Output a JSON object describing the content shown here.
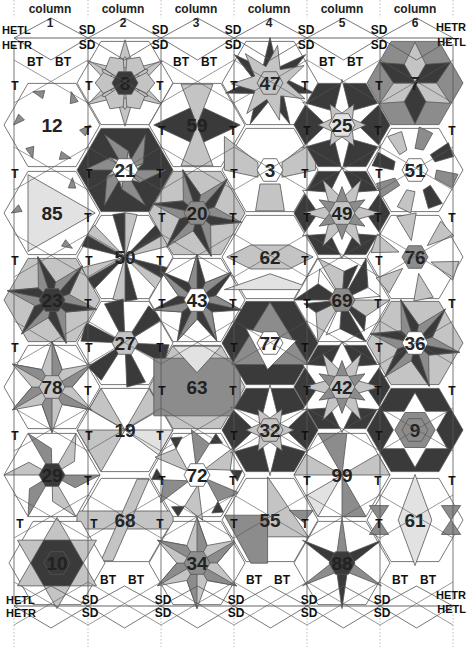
{
  "diagram": {
    "colors": {
      "line": "#555555",
      "dark": "#3a3a3a",
      "mid": "#8c8c8c",
      "light": "#c4c4c4",
      "pale": "#e2e2e2",
      "white": "#ffffff",
      "text": "#1a1a1a"
    },
    "column_headers": [
      {
        "word": "column",
        "num": "1",
        "x": 50
      },
      {
        "word": "column",
        "num": "2",
        "x": 123
      },
      {
        "word": "column",
        "num": "3",
        "x": 196
      },
      {
        "word": "column",
        "num": "4",
        "x": 269
      },
      {
        "word": "column",
        "num": "5",
        "x": 342
      },
      {
        "word": "column",
        "num": "6",
        "x": 415
      }
    ],
    "edge_labels": {
      "top_left": [
        "HETL",
        "HETR"
      ],
      "top_right": [
        "HETR",
        "HETL"
      ],
      "bottom_left": [
        "HETL",
        "HETR"
      ],
      "bottom_right": [
        "HETR",
        "HETL"
      ],
      "top_sd": [
        {
          "x": 87,
          "text": "SD"
        },
        {
          "x": 160,
          "text": "SD"
        },
        {
          "x": 233,
          "text": "SD"
        },
        {
          "x": 306,
          "text": "SD"
        },
        {
          "x": 379,
          "text": "SD"
        }
      ],
      "bottom_sd": [
        {
          "x": 90,
          "text": "SD"
        },
        {
          "x": 163,
          "text": "SD"
        },
        {
          "x": 236,
          "text": "SD"
        },
        {
          "x": 309,
          "text": "SD"
        },
        {
          "x": 382,
          "text": "SD"
        }
      ],
      "top_bt": [
        {
          "x": 35,
          "text": "BT"
        },
        {
          "x": 63,
          "text": "BT"
        },
        {
          "x": 181,
          "text": "BT"
        },
        {
          "x": 209,
          "text": "BT"
        },
        {
          "x": 327,
          "text": "BT"
        },
        {
          "x": 355,
          "text": "BT"
        }
      ],
      "bottom_bt": [
        {
          "x": 108,
          "text": "BT"
        },
        {
          "x": 136,
          "text": "BT"
        },
        {
          "x": 254,
          "text": "BT"
        },
        {
          "x": 282,
          "text": "BT"
        },
        {
          "x": 400,
          "text": "BT"
        },
        {
          "x": 428,
          "text": "BT"
        }
      ],
      "t_label": "T"
    },
    "tiles": [
      {
        "id": "8",
        "col": 2,
        "cx": 125,
        "cy": 83,
        "style": "flower",
        "center": "dark"
      },
      {
        "id": "21",
        "col": 2,
        "cx": 125,
        "cy": 170,
        "style": "pinwheel",
        "center": "white"
      },
      {
        "id": "50",
        "col": 2,
        "cx": 125,
        "cy": 257,
        "style": "star6dark",
        "center": "none"
      },
      {
        "id": "27",
        "col": 2,
        "cx": 125,
        "cy": 343,
        "style": "fan",
        "center": "light"
      },
      {
        "id": "19",
        "col": 2,
        "cx": 125,
        "cy": 430,
        "style": "shards",
        "center": "none"
      },
      {
        "id": "68",
        "col": 2,
        "cx": 125,
        "cy": 520,
        "style": "band",
        "center": "none"
      },
      {
        "id": "12",
        "col": 1,
        "cx": 52,
        "cy": 125,
        "style": "trinotch",
        "center": "none"
      },
      {
        "id": "85",
        "col": 1,
        "cx": 52,
        "cy": 213,
        "style": "triangle",
        "center": "none"
      },
      {
        "id": "23",
        "col": 1,
        "cx": 52,
        "cy": 300,
        "style": "star6mid",
        "center": "dark"
      },
      {
        "id": "78",
        "col": 1,
        "cx": 52,
        "cy": 387,
        "style": "star6light",
        "center": "light"
      },
      {
        "id": "29",
        "col": 1,
        "cx": 52,
        "cy": 475,
        "style": "prism",
        "center": "dark"
      },
      {
        "id": "10",
        "col": 1,
        "cx": 57,
        "cy": 563,
        "style": "david",
        "center": "dark"
      },
      {
        "id": "59",
        "col": 3,
        "cx": 197,
        "cy": 125,
        "style": "bowtie",
        "center": "none"
      },
      {
        "id": "20",
        "col": 3,
        "cx": 197,
        "cy": 213,
        "style": "star6mid",
        "center": "mid"
      },
      {
        "id": "43",
        "col": 3,
        "cx": 197,
        "cy": 300,
        "style": "pinstar",
        "center": "white"
      },
      {
        "id": "63",
        "col": 3,
        "cx": 197,
        "cy": 387,
        "style": "rect",
        "center": "none"
      },
      {
        "id": "72",
        "col": 3,
        "cx": 197,
        "cy": 475,
        "style": "spiral",
        "center": "white"
      },
      {
        "id": "34",
        "col": 3,
        "cx": 197,
        "cy": 563,
        "style": "star6light",
        "center": "mid"
      },
      {
        "id": "47",
        "col": 4,
        "cx": 270,
        "cy": 83,
        "style": "star6open",
        "center": "light"
      },
      {
        "id": "3",
        "col": 4,
        "cx": 270,
        "cy": 170,
        "style": "hourglass",
        "center": "white"
      },
      {
        "id": "62",
        "col": 4,
        "cx": 270,
        "cy": 257,
        "style": "diamondbar",
        "center": "none"
      },
      {
        "id": "77",
        "col": 4,
        "cx": 270,
        "cy": 343,
        "style": "triangledark",
        "center": "white"
      },
      {
        "id": "32",
        "col": 4,
        "cx": 270,
        "cy": 430,
        "style": "star6dark2",
        "center": "light"
      },
      {
        "id": "55",
        "col": 4,
        "cx": 270,
        "cy": 520,
        "style": "kite",
        "center": "none"
      },
      {
        "id": "25",
        "col": 5,
        "cx": 342,
        "cy": 125,
        "style": "star6dark2",
        "center": "pale"
      },
      {
        "id": "49",
        "col": 5,
        "cx": 342,
        "cy": 213,
        "style": "star12",
        "center": "light"
      },
      {
        "id": "69",
        "col": 5,
        "cx": 342,
        "cy": 300,
        "style": "pinwheel2",
        "center": "mid"
      },
      {
        "id": "42",
        "col": 5,
        "cx": 342,
        "cy": 387,
        "style": "star12",
        "center": "light"
      },
      {
        "id": "99",
        "col": 5,
        "cx": 342,
        "cy": 475,
        "style": "shards2",
        "center": "none"
      },
      {
        "id": "88",
        "col": 5,
        "cx": 342,
        "cy": 563,
        "style": "spokes",
        "center": "dark"
      },
      {
        "id": "7",
        "col": 6,
        "cx": 415,
        "cy": 83,
        "style": "cube",
        "center": "none"
      },
      {
        "id": "51",
        "col": 6,
        "cx": 415,
        "cy": 170,
        "style": "ring",
        "center": "white"
      },
      {
        "id": "76",
        "col": 6,
        "cx": 415,
        "cy": 257,
        "style": "fan2",
        "center": "mid"
      },
      {
        "id": "36",
        "col": 6,
        "cx": 415,
        "cy": 343,
        "style": "star6mid",
        "center": "white"
      },
      {
        "id": "9",
        "col": 6,
        "cx": 415,
        "cy": 430,
        "style": "davidring",
        "center": "mid"
      },
      {
        "id": "61",
        "col": 6,
        "cx": 415,
        "cy": 520,
        "style": "diamondlight",
        "center": "none"
      }
    ]
  }
}
